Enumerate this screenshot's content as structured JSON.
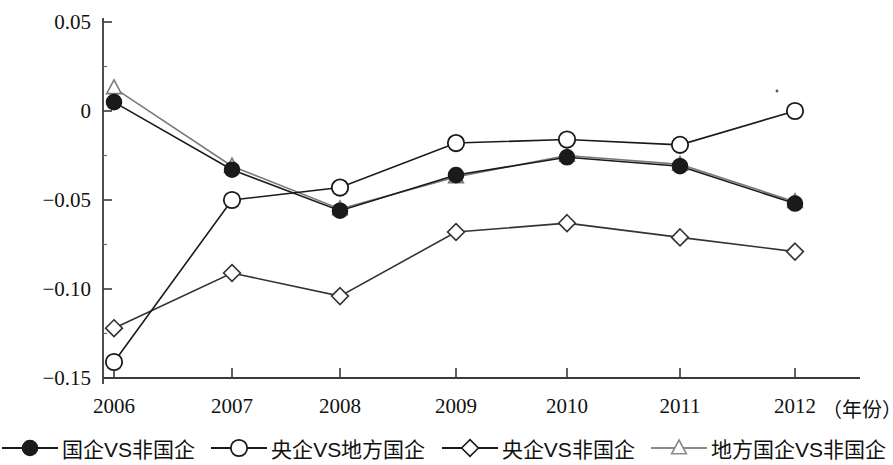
{
  "chart_data": {
    "type": "line",
    "title": "",
    "xlabel": "（年份）",
    "ylabel": "",
    "x": [
      2006,
      2007,
      2008,
      2009,
      2010,
      2011,
      2012
    ],
    "categories": [
      "2006",
      "2007",
      "2008",
      "2009",
      "2010",
      "2011",
      "2012"
    ],
    "xtick_labels": [
      "2006",
      "2007",
      "2008",
      "2009",
      "2010",
      "2011",
      "2012"
    ],
    "ytick_labels": [
      "0.05",
      "0",
      "−0.05",
      "−0.10",
      "−0.15"
    ],
    "ytick_values": [
      0.05,
      0,
      -0.05,
      -0.1,
      -0.15
    ],
    "ylim": [
      -0.15,
      0.05
    ],
    "xlim": [
      2006,
      2012
    ],
    "grid": false,
    "legend_position": "bottom",
    "series": [
      {
        "name": "国企VS非国企",
        "marker": "filled-circle",
        "color": "#1a1a1a",
        "values": [
          0.005,
          -0.033,
          -0.056,
          -0.036,
          -0.026,
          -0.031,
          -0.052
        ]
      },
      {
        "name": "央企VS地方国企",
        "marker": "open-circle",
        "color": "#1a1a1a",
        "values": [
          -0.141,
          -0.05,
          -0.043,
          -0.018,
          -0.016,
          -0.019,
          0.0
        ]
      },
      {
        "name": "央企VS非国企",
        "marker": "open-diamond",
        "color": "#333333",
        "values": [
          -0.122,
          -0.091,
          -0.104,
          -0.068,
          -0.063,
          -0.071,
          -0.079
        ]
      },
      {
        "name": "地方国企VS非国企",
        "marker": "open-triangle",
        "color": "#7a7a7a",
        "values": [
          0.013,
          -0.031,
          -0.055,
          -0.037,
          -0.025,
          -0.03,
          -0.051
        ]
      }
    ]
  },
  "axes": {
    "y_ticks": [
      {
        "label": "0.05",
        "value": 0.05
      },
      {
        "label": "0",
        "value": 0
      },
      {
        "label": "−0.05",
        "value": -0.05
      },
      {
        "label": "−0.10",
        "value": -0.1
      },
      {
        "label": "−0.15",
        "value": -0.15
      }
    ],
    "x_ticks": [
      {
        "label": "2006",
        "value": 2006
      },
      {
        "label": "2007",
        "value": 2007
      },
      {
        "label": "2008",
        "value": 2008
      },
      {
        "label": "2009",
        "value": 2009
      },
      {
        "label": "2010",
        "value": 2010
      },
      {
        "label": "2011",
        "value": 2011
      },
      {
        "label": "2012",
        "value": 2012
      }
    ],
    "x_unit_label": "（年份）"
  },
  "legend": {
    "items": [
      {
        "label": "国企VS非国企",
        "marker": "filled-circle"
      },
      {
        "label": "央企VS地方国企",
        "marker": "open-circle"
      },
      {
        "label": "央企VS非国企",
        "marker": "open-diamond"
      },
      {
        "label": "地方国企VS非国企",
        "marker": "open-triangle"
      }
    ]
  }
}
